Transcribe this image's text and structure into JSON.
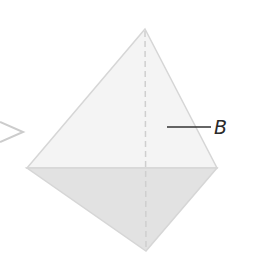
{
  "figure": {
    "type": "tetrahedron-diagram",
    "labels": {
      "face_label": "B"
    },
    "colors": {
      "upper_face_fill": "#f4f4f4",
      "lower_face_fill": "#e2e2e2",
      "edge_stroke": "#d6d6d6",
      "hidden_edge_stroke": "#cfcfcf",
      "leader_line": "#333333",
      "side_shape_stroke": "#cccccc"
    }
  }
}
